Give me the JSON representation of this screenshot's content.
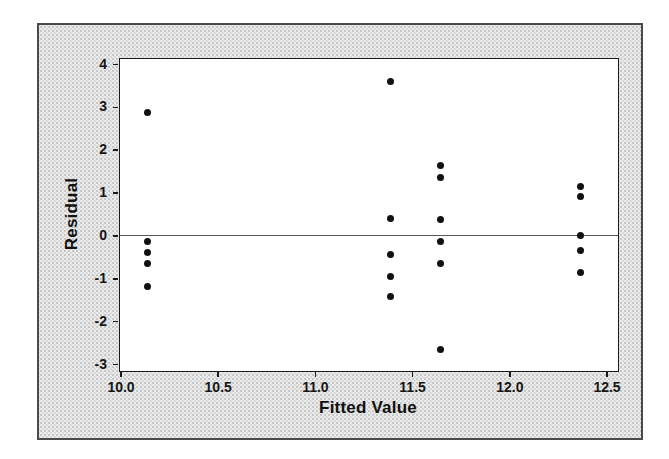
{
  "chart_data": {
    "type": "scatter",
    "title": "",
    "xlabel": "Fitted Value",
    "ylabel": "Residual",
    "xlim": [
      10.0,
      12.5
    ],
    "ylim": [
      -3,
      4
    ],
    "x_ticks": [
      10.0,
      10.5,
      11.0,
      11.5,
      12.0,
      12.5
    ],
    "x_tick_labels": [
      "10.0",
      "10.5",
      "11.0",
      "11.5",
      "12.0",
      "12.5"
    ],
    "y_ticks": [
      4,
      3,
      2,
      1,
      0,
      -1,
      -2,
      -3
    ],
    "y_tick_labels": [
      "4",
      "3",
      "2",
      "1",
      "0",
      "-1",
      "-2",
      "-3"
    ],
    "reference_line_y": 0,
    "grid": false,
    "legend": null,
    "marker_color": "#111111",
    "reference_line_color": "#5a5a5a",
    "points": [
      {
        "x": 10.13,
        "y": 2.87
      },
      {
        "x": 10.13,
        "y": -0.15
      },
      {
        "x": 10.13,
        "y": -0.4
      },
      {
        "x": 10.13,
        "y": -0.65
      },
      {
        "x": 10.13,
        "y": -1.18
      },
      {
        "x": 11.38,
        "y": 3.6
      },
      {
        "x": 11.38,
        "y": 0.4
      },
      {
        "x": 11.38,
        "y": -0.45
      },
      {
        "x": 11.38,
        "y": -0.95
      },
      {
        "x": 11.38,
        "y": -1.43
      },
      {
        "x": 11.64,
        "y": 1.63
      },
      {
        "x": 11.64,
        "y": 1.35
      },
      {
        "x": 11.64,
        "y": 0.38
      },
      {
        "x": 11.64,
        "y": -0.14
      },
      {
        "x": 11.64,
        "y": -0.65
      },
      {
        "x": 11.64,
        "y": -2.67
      },
      {
        "x": 12.36,
        "y": 1.15
      },
      {
        "x": 12.36,
        "y": 0.92
      },
      {
        "x": 12.36,
        "y": 0.0
      },
      {
        "x": 12.36,
        "y": -0.36
      },
      {
        "x": 12.36,
        "y": -0.87
      }
    ]
  }
}
